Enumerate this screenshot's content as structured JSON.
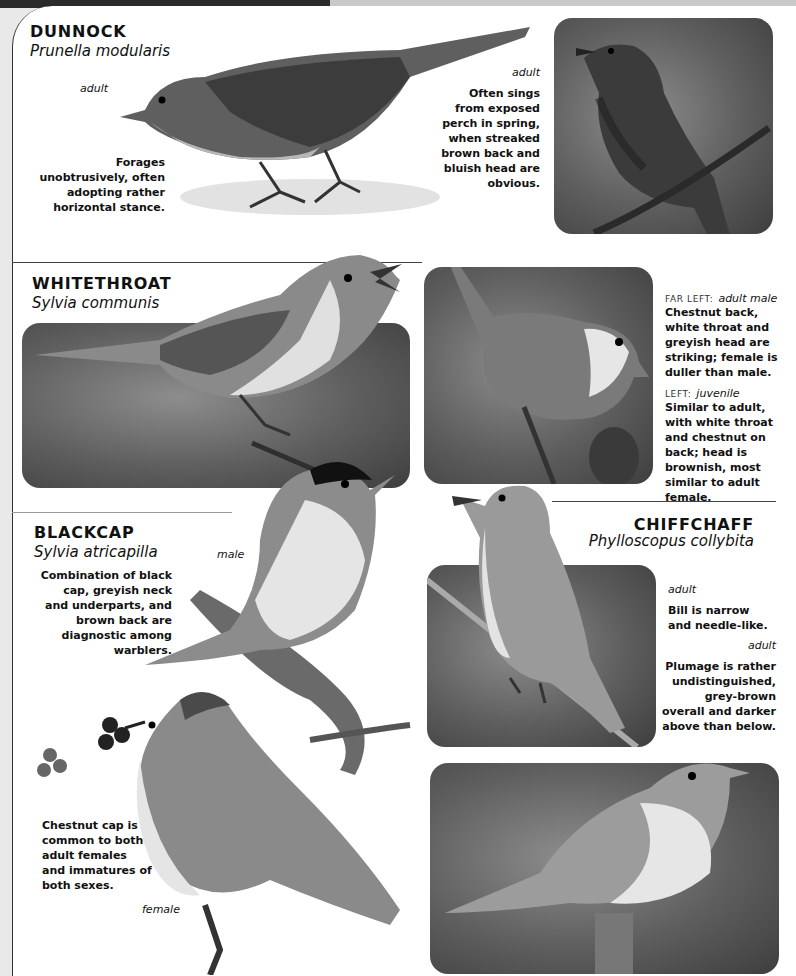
{
  "page": {
    "theme_colors": {
      "page_bg": "#ffffff",
      "band": "#2b2b2b",
      "text": "#111111",
      "photo_bg": "#5e5e5e"
    }
  },
  "species": [
    {
      "name": "DUNNOCK",
      "latin": "Prunella modularis",
      "illustration_label": "adult",
      "illustration_text": "Forages unobtrusively, often adopting rather horizontal stance.",
      "photo_label": "adult",
      "photo_text": "Often sings from exposed perch in spring, when streaked brown back and bluish head are obvious."
    },
    {
      "name": "WHITETHROAT",
      "latin": "Sylvia communis",
      "note1_prefix": "FAR LEFT:",
      "note1_label": "adult male",
      "note1_text": "Chestnut back, white throat and greyish head are striking; female is duller than male.",
      "note2_prefix": "LEFT:",
      "note2_label": "juvenile",
      "note2_text": "Similar to adult, with white throat and chestnut on back; head is brownish, most similar to adult female."
    },
    {
      "name": "BLACKCAP",
      "latin": "Sylvia atricapilla",
      "male_label": "male",
      "male_text": "Combination of black cap, greyish neck and underparts, and brown back are diagnostic among warblers.",
      "female_label": "female",
      "female_text": "Chestnut cap is common to both adult females and immatures of both sexes."
    },
    {
      "name": "CHIFFCHAFF",
      "latin": "Phylloscopus collybita",
      "label1": "adult",
      "text1": "Bill is narrow and needle-like.",
      "label2": "adult",
      "text2": "Plumage is rather undistinguished, grey-brown overall and darker above than below."
    }
  ]
}
